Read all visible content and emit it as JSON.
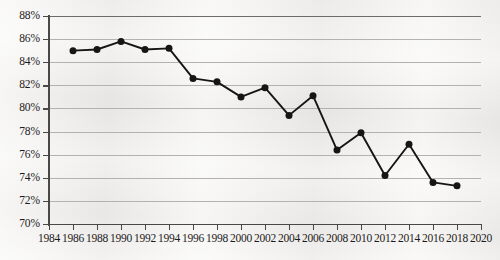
{
  "chart_data": {
    "type": "line",
    "title": "",
    "subtitle": "",
    "xlabel": "",
    "ylabel": "",
    "x": [
      1986,
      1988,
      1990,
      1992,
      1994,
      1996,
      1998,
      2000,
      2002,
      2004,
      2006,
      2008,
      2010,
      2012,
      2014,
      2016,
      2018
    ],
    "values": [
      85.0,
      85.1,
      85.8,
      85.1,
      85.2,
      82.6,
      82.3,
      81.0,
      81.8,
      79.4,
      81.1,
      76.4,
      77.9,
      74.2,
      76.9,
      73.6,
      73.3
    ],
    "series": [
      {
        "name": "",
        "values": [
          85.0,
          85.1,
          85.8,
          85.1,
          85.2,
          82.6,
          82.3,
          81.0,
          81.8,
          79.4,
          81.1,
          76.4,
          77.9,
          74.2,
          76.9,
          73.6,
          73.3
        ]
      }
    ],
    "xlim": [
      1984,
      2020
    ],
    "ylim": [
      70,
      88
    ],
    "x_tick_labels": [
      "1984",
      "1986",
      "1988",
      "1990",
      "1992",
      "1994",
      "1996",
      "1998",
      "2000",
      "2002",
      "2004",
      "2006",
      "2008",
      "2010",
      "2012",
      "2014",
      "2016",
      "2018",
      "2020"
    ],
    "x_tick_values": [
      1984,
      1986,
      1988,
      1990,
      1992,
      1994,
      1996,
      1998,
      2000,
      2002,
      2004,
      2006,
      2008,
      2010,
      2012,
      2014,
      2016,
      2018,
      2020
    ],
    "y_tick_labels": [
      "88%",
      "86%",
      "84%",
      "82%",
      "80%",
      "78%",
      "76%",
      "74%",
      "72%",
      "70%"
    ],
    "y_tick_values": [
      88,
      86,
      84,
      82,
      80,
      78,
      76,
      74,
      72,
      70
    ],
    "grid": true,
    "legend": false,
    "legend_position": "none",
    "marker": "circle",
    "line_color": "#171514",
    "grid_color": "#b4b2b0",
    "axis_color": "#4a4846",
    "background_color": "#f2f0ee"
  }
}
